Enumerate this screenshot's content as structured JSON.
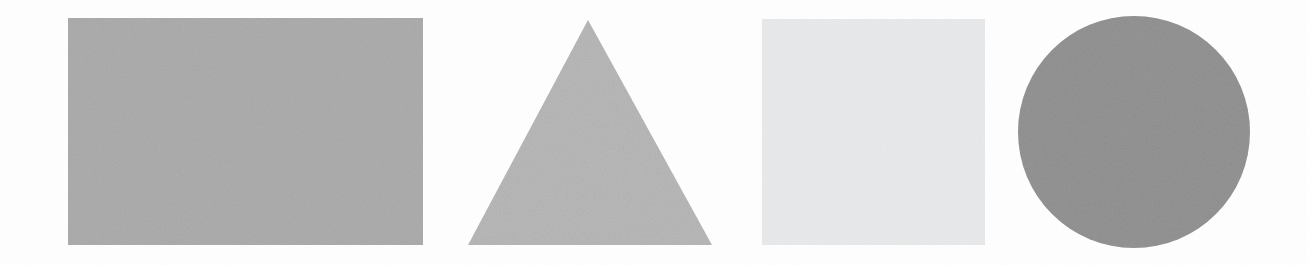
{
  "page": {
    "width": 1307,
    "height": 265,
    "background_color": "#FFFFFF"
  },
  "shapes": [
    {
      "id": "rectangle",
      "name": "rectangle",
      "label": "Rectangle",
      "fill_color": "#A8A8A8",
      "tone": "medium gray",
      "x": 68,
      "y": 18,
      "width": 355,
      "height": 227
    },
    {
      "id": "triangle",
      "name": "triangle",
      "label": "Triangle",
      "fill_color": "#B6B6B6",
      "tone": "light-medium gray",
      "x": 468,
      "y": 20,
      "width": 244,
      "height": 225,
      "apex_x": 588,
      "apex_y": 20,
      "base_left_x": 468,
      "base_right_x": 712,
      "base_y": 245
    },
    {
      "id": "square",
      "name": "square",
      "label": "Square",
      "fill_color": "#E8E9EA",
      "tone": "very light gray",
      "x": 762,
      "y": 19,
      "width": 223,
      "height": 226
    },
    {
      "id": "circle",
      "name": "circle",
      "label": "Circle",
      "fill_color": "#8E8E8E",
      "tone": "dark gray",
      "center_x": 1134,
      "center_y": 132,
      "diameter": 232,
      "radius": 116
    }
  ]
}
